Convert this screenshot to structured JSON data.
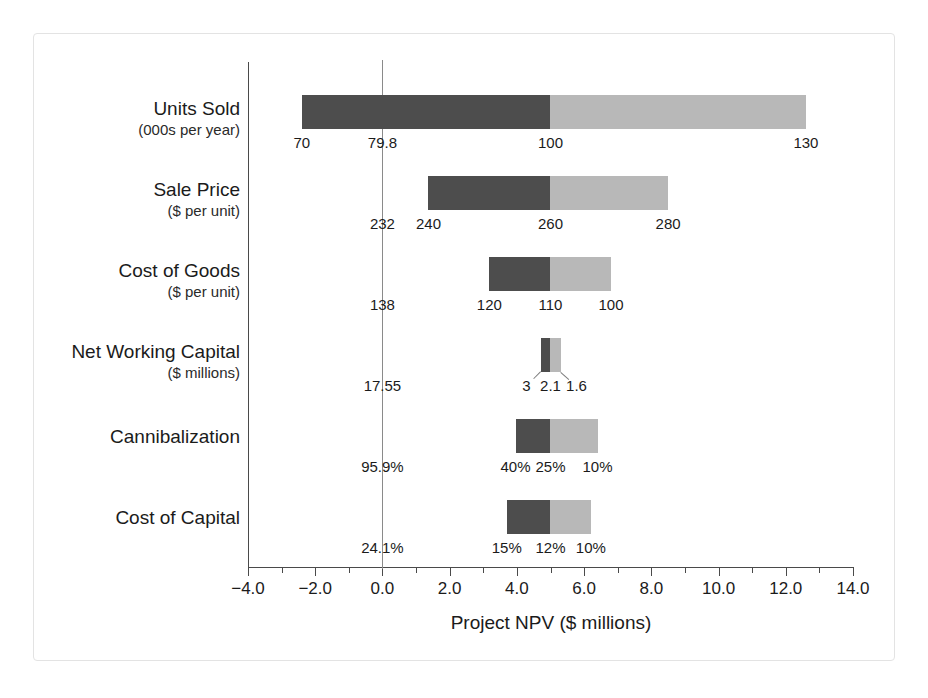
{
  "chart_data": {
    "type": "bar",
    "subtype": "tornado",
    "title": "",
    "xlabel": "Project NPV ($ millions)",
    "ylabel": "",
    "xlim": [
      -4.0,
      14.0
    ],
    "base_value": 5.0,
    "grid": false,
    "legend": null,
    "xticks": [
      -4.0,
      -2.0,
      0.0,
      2.0,
      4.0,
      6.0,
      8.0,
      10.0,
      12.0,
      14.0
    ],
    "xtick_labels": [
      "−4.0",
      "−2.0",
      "0.0",
      "2.0",
      "4.0",
      "6.0",
      "8.0",
      "10.0",
      "12.0",
      "14.0"
    ],
    "zero_line": 0.0,
    "categories": [
      {
        "name": "Units Sold",
        "unit": "(000s per year)",
        "low_npv": -2.4,
        "base_npv": 5.0,
        "high_npv": 12.6,
        "low_input": "70",
        "base_input": "79.8",
        "high_input": "130",
        "mid_input": "100",
        "base_marker_npv": 0.0,
        "mid_npv": 5.0,
        "labels_inline": true
      },
      {
        "name": "Sale Price",
        "unit": "($ per unit)",
        "low_npv": 1.37,
        "base_npv": 5.0,
        "high_npv": 8.5,
        "low_input": "240",
        "base_input": "232",
        "high_input": "280",
        "mid_input": "260",
        "base_marker_npv": 0.0,
        "mid_npv": 5.0,
        "labels_inline": true
      },
      {
        "name": "Cost of Goods",
        "unit": "($ per unit)",
        "low_npv": 3.18,
        "base_npv": 5.0,
        "high_npv": 6.8,
        "low_input": "120",
        "base_input": "138",
        "high_input": "100",
        "mid_input": "110",
        "base_marker_npv": 0.0,
        "mid_npv": 5.0,
        "labels_inline": true
      },
      {
        "name": "Net Working Capital",
        "unit": "($ millions)",
        "low_npv": 4.73,
        "base_npv": 5.0,
        "high_npv": 5.3,
        "low_input": "3",
        "base_input": "17.55",
        "high_input": "1.6",
        "mid_input": "2.1",
        "base_marker_npv": 0.0,
        "mid_npv": 5.0,
        "labels_inline": false
      },
      {
        "name": "Cannibalization",
        "unit": "",
        "low_npv": 3.96,
        "base_npv": 5.0,
        "high_npv": 6.4,
        "low_input": "40%",
        "base_input": "95.9%",
        "high_input": "10%",
        "mid_input": "25%",
        "base_marker_npv": 0.0,
        "mid_npv": 5.0,
        "labels_inline": true
      },
      {
        "name": "Cost of Capital",
        "unit": "",
        "low_npv": 3.7,
        "base_npv": 5.0,
        "high_npv": 6.2,
        "low_input": "15%",
        "base_input": "24.1%",
        "high_input": "10%",
        "mid_input": "12%",
        "base_marker_npv": 0.0,
        "mid_npv": 5.0,
        "labels_inline": true
      }
    ],
    "colors": {
      "low_segment": "#4d4d4d",
      "high_segment": "#b8b8b8",
      "axis": "#4a4a4a",
      "reference_line": "#8a8a8a",
      "text": "#1b1b1b",
      "background": "#ffffff",
      "frame": "#e3e3e3"
    }
  }
}
